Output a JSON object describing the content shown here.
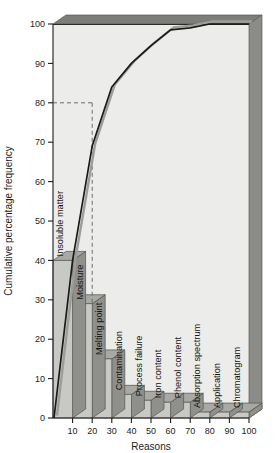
{
  "chart_data": {
    "type": "bar",
    "title": "",
    "subtitle": "",
    "xlabel": "Reasons",
    "ylabel": "Cumulative percentage frequency",
    "categories": [
      "Insoluble matter",
      "Moisture",
      "Melting point",
      "Contamination",
      "Process failure",
      "Iron content",
      "Phenol content",
      "Absorption spectrum",
      "Application",
      "Chromatogram"
    ],
    "values": [
      40,
      29,
      15,
      6,
      4.5,
      4,
      4,
      1.5,
      1.5,
      1.5
    ],
    "series": [
      {
        "name": "Percentage frequency",
        "type": "bar",
        "values": [
          40,
          29,
          15,
          6,
          4.5,
          4,
          4,
          1.5,
          1.5,
          1.5
        ]
      },
      {
        "name": "Cumulative percentage frequency",
        "type": "line",
        "values": [
          40,
          69,
          84,
          90,
          94.5,
          98.5,
          99,
          100,
          100,
          100
        ]
      }
    ],
    "x": [
      10,
      20,
      30,
      40,
      50,
      60,
      70,
      80,
      90,
      100
    ],
    "xticks": [
      10,
      20,
      30,
      40,
      50,
      60,
      70,
      80,
      90,
      100
    ],
    "yticks": [
      0,
      10,
      20,
      30,
      40,
      50,
      60,
      70,
      80,
      90,
      100
    ],
    "xlim": [
      0,
      100
    ],
    "ylim": [
      0,
      100
    ],
    "grid": false,
    "legend": null,
    "legend_position": "none",
    "annotations": [
      {
        "name": "eighty-percent-reference",
        "type": "dashed-guide",
        "y": 80,
        "x": 20,
        "description": "Dashed line from y-axis at 80 across to the cumulative curve, then down to the x-axis near 20"
      }
    ],
    "style": {
      "three_d": true,
      "bar_face": "#c8c8c4",
      "bar_top": "#a8a8a4",
      "bar_side": "#8f8f8c",
      "plot_background": "#ececeb",
      "wall_top": "#7d7d7a",
      "wall_right": "#8b8b88",
      "line_color": "#1a1a1a",
      "line_shadow": "#9d9d9a",
      "axis_color": "#1c1c1c",
      "dash_color": "#6d6d6a"
    }
  }
}
